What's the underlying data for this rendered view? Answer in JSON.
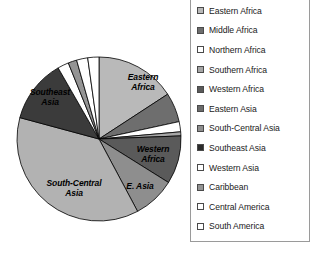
{
  "chart_data": {
    "type": "pie",
    "title": "",
    "subtitle": "",
    "xlabel": "",
    "ylabel": "",
    "legend_position": "right",
    "grid": false,
    "start_angle_deg": 0,
    "direction": "clockwise",
    "categories": [
      "Eastern Africa",
      "Middle Africa",
      "Northern Africa",
      "Southern Africa",
      "Western Africa",
      "Eastern Asia",
      "South-Central Asia",
      "Southeast Asia",
      "Western Asia",
      "Caribbean",
      "Central America",
      "South America"
    ],
    "values": [
      15.8,
      5.8,
      2.0,
      0.8,
      9.5,
      8.3,
      37.0,
      12.5,
      2.2,
      1.7,
      2.2,
      2.2
    ],
    "colors": [
      "#b9b9b9",
      "#6e6e6e",
      "#ffffff",
      "#a6a6a6",
      "#5a5a5a",
      "#8e8e8e",
      "#b2b2b2",
      "#3b3b3b",
      "#ffffff",
      "#949494",
      "#ffffff",
      "#ffffff"
    ],
    "slice_edge_color": "#000000",
    "labels_shown": [
      "Eastern Africa",
      "Western Africa",
      "E. Asia",
      "South-Central Asia",
      "Southeast Asia"
    ]
  },
  "pie": {
    "center_x": 99,
    "center_y": 139,
    "radius": 82,
    "slice_labels": [
      {
        "text": "Eastern\nAfrica",
        "x": 116,
        "y": 72,
        "w": 54
      },
      {
        "text": "Western\nAfrica",
        "x": 125,
        "y": 144,
        "w": 56
      },
      {
        "text": "E. Asia",
        "x": 119,
        "y": 181,
        "w": 42
      },
      {
        "text": "South-Central\nAsia",
        "x": 32,
        "y": 178,
        "w": 84
      },
      {
        "text": "Southeast\nAsia",
        "x": 19,
        "y": 87,
        "w": 62
      }
    ]
  },
  "legend": {
    "items": [
      {
        "label": "Eastern Africa",
        "color": "#b9b9b9"
      },
      {
        "label": "Middle Africa",
        "color": "#6e6e6e"
      },
      {
        "label": "Northern Africa",
        "color": "#ffffff"
      },
      {
        "label": "Southern Africa",
        "color": "#a6a6a6"
      },
      {
        "label": "Western Africa",
        "color": "#5a5a5a"
      },
      {
        "label": "Eastern Asia",
        "color": "#6b6b6b"
      },
      {
        "label": "South-Central Asia",
        "color": "#8e8e8e"
      },
      {
        "label": "Southeast Asia",
        "color": "#2b2b2b"
      },
      {
        "label": "Western Asia",
        "color": "#ffffff"
      },
      {
        "label": "Caribbean",
        "color": "#949494"
      },
      {
        "label": "Central America",
        "color": "#ffffff"
      },
      {
        "label": "South America",
        "color": "#ffffff"
      }
    ]
  }
}
